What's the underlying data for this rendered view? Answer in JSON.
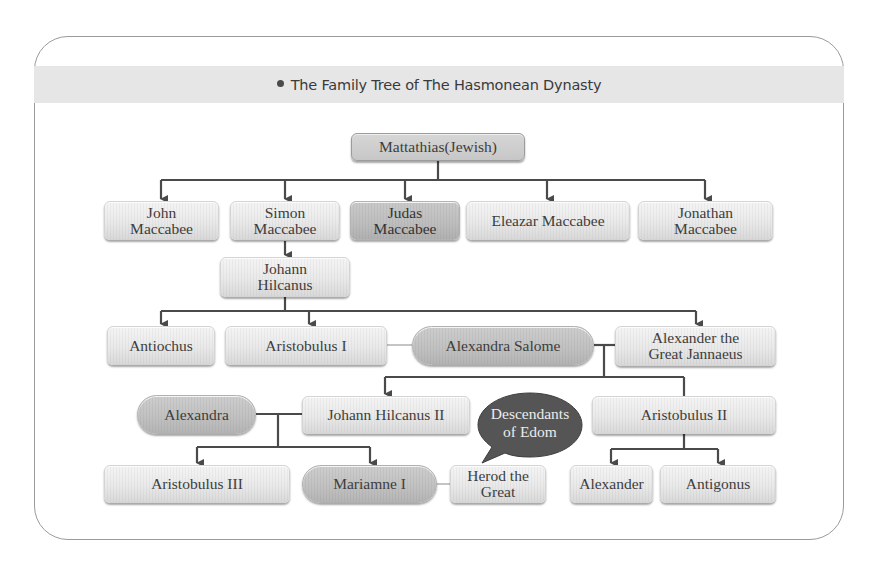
{
  "title": {
    "bullet_icon": "bullet-dot",
    "text": "The Family Tree of The Hasmonean Dynasty"
  },
  "colors": {
    "title_band": "#e6e6e6",
    "node_light": "#e9e9e9",
    "node_dark": "#bdbdbd",
    "connector": "#4a4a4a",
    "spouse_link": "#b5b5b5",
    "bubble": "#555555",
    "bubble_text": "#ececec"
  },
  "tree": {
    "root": {
      "label": "Mattathias(Jewish)"
    },
    "generation_1": [
      {
        "id": "john",
        "label": "John\nMaccabee"
      },
      {
        "id": "simon",
        "label": "Simon\nMaccabee"
      },
      {
        "id": "judas",
        "label": "Judas\nMaccabee",
        "highlighted": true
      },
      {
        "id": "eleazar",
        "label": "Eleazar Maccabee"
      },
      {
        "id": "jonathan",
        "label": "Jonathan\nMaccabee"
      }
    ],
    "generation_2": [
      {
        "id": "johann_hilcanus",
        "label": "Johann\nHilcanus",
        "parent": "simon"
      }
    ],
    "generation_3": [
      {
        "id": "antiochus",
        "label": "Antiochus",
        "parent": "johann_hilcanus"
      },
      {
        "id": "aristobulus_1",
        "label": "Aristobulus I",
        "parent": "johann_hilcanus"
      },
      {
        "id": "alexandra_salome",
        "label": "Alexandra Salome",
        "spouse_of": [
          "aristobulus_1",
          "alexander_jannaeus"
        ]
      },
      {
        "id": "alexander_jannaeus",
        "label": "Alexander the\nGreat Jannaeus",
        "parent": "johann_hilcanus"
      }
    ],
    "generation_4": [
      {
        "id": "alexandra",
        "label": "Alexandra",
        "spouse_of": [
          "johann_hilcanus_2"
        ]
      },
      {
        "id": "johann_hilcanus_2",
        "label": "Johann Hilcanus II",
        "parent": "alexander_jannaeus"
      },
      {
        "id": "aristobulus_2",
        "label": "Aristobulus II",
        "parent": "alexander_jannaeus"
      }
    ],
    "generation_5": [
      {
        "id": "aristobulus_3",
        "label": "Aristobulus III",
        "parent": "johann_hilcanus_2"
      },
      {
        "id": "mariamne_1",
        "label": "Mariamne I",
        "parent": "johann_hilcanus_2",
        "spouse_of": [
          "herod"
        ]
      },
      {
        "id": "herod",
        "label": "Herod the\nGreat"
      },
      {
        "id": "alexander",
        "label": "Alexander",
        "parent": "aristobulus_2"
      },
      {
        "id": "antigonus",
        "label": "Antigonus",
        "parent": "aristobulus_2"
      }
    ]
  },
  "callout": {
    "text": "Descendants\nof Edom",
    "points_to": "herod"
  }
}
